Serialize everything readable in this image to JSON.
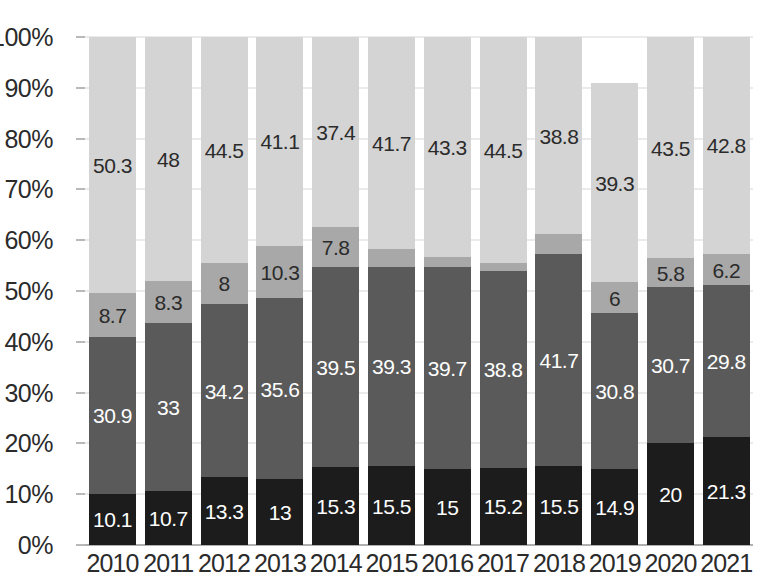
{
  "chart_data": {
    "type": "bar",
    "stacked": true,
    "normalized_percent": true,
    "title": "",
    "subtitle": "",
    "xlabel": "",
    "ylabel": "",
    "ylim": [
      0,
      100
    ],
    "ytick_labels": [
      "0%",
      "10%",
      "20%",
      "30%",
      "40%",
      "50%",
      "60%",
      "70%",
      "80%",
      "90%",
      "100%"
    ],
    "ytick_values": [
      0,
      10,
      20,
      30,
      40,
      50,
      60,
      70,
      80,
      90,
      100
    ],
    "grid": true,
    "legend": "none",
    "categories": [
      "2010",
      "2011",
      "2012",
      "2013",
      "2014",
      "2015",
      "2016",
      "2017",
      "2018",
      "2019",
      "2020",
      "2021"
    ],
    "series": [
      {
        "name": "segment-1",
        "color": "#1c1c1c",
        "label_color": "#ffffff",
        "values": [
          10.1,
          10.7,
          13.3,
          13,
          15.3,
          15.5,
          15,
          15.2,
          15.5,
          14.9,
          20,
          21.3
        ],
        "labels": [
          "10.1",
          "10.7",
          "13.3",
          "13",
          "15.3",
          "15.5",
          "15",
          "15.2",
          "15.5",
          "14.9",
          "20",
          "21.3"
        ]
      },
      {
        "name": "segment-2",
        "color": "#5a5a5a",
        "label_color": "#ffffff",
        "values": [
          30.9,
          33,
          34.2,
          35.6,
          39.5,
          39.3,
          39.7,
          38.8,
          41.7,
          30.8,
          30.7,
          29.8
        ],
        "labels": [
          "30.9",
          "33",
          "34.2",
          "35.6",
          "39.5",
          "39.3",
          "39.7",
          "38.8",
          "41.7",
          "30.8",
          "30.7",
          "29.8"
        ]
      },
      {
        "name": "segment-3",
        "color": "#a8a8a8",
        "label_color": "#2b2b2b",
        "values": [
          8.7,
          8.3,
          8,
          10.3,
          7.8,
          3.5,
          2,
          1.5,
          4,
          6,
          5.8,
          6.2
        ],
        "labels": [
          "8.7",
          "8.3",
          "8",
          "10.3",
          "7.8",
          "3.5",
          "2",
          "1.5",
          "4",
          "6",
          "5.8",
          "6.2"
        ]
      },
      {
        "name": "segment-4",
        "color": "#d4d4d4",
        "label_color": "#2b2b2b",
        "values": [
          50.3,
          48,
          44.5,
          41.1,
          37.4,
          41.7,
          43.3,
          44.5,
          38.8,
          39.3,
          43.5,
          42.8
        ],
        "labels": [
          "50.3",
          "48",
          "44.5",
          "41.1",
          "37.4",
          "41.7",
          "43.3",
          "44.5",
          "38.8",
          "39.3",
          "43.5",
          "42.8"
        ]
      }
    ]
  }
}
